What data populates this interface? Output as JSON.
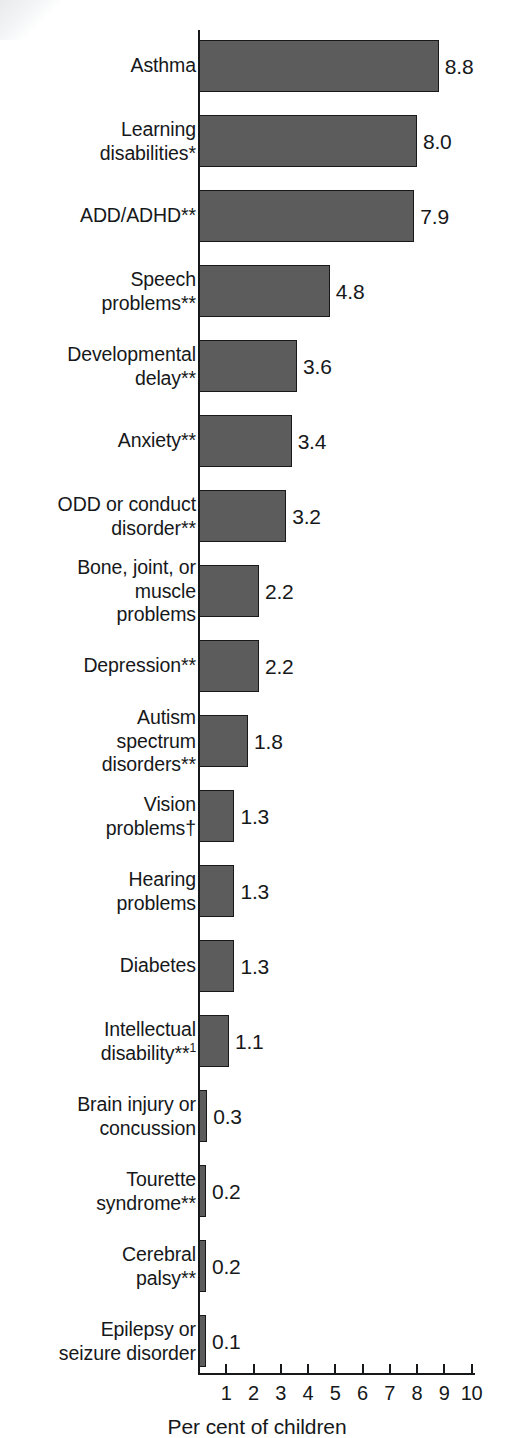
{
  "chart_data": {
    "type": "bar",
    "orientation": "horizontal",
    "title": "",
    "xlabel": "Per cent of children",
    "ylabel": "",
    "xlim": [
      0,
      10
    ],
    "grid": false,
    "legend": null,
    "tick_labels": [
      "1",
      "2",
      "3",
      "4",
      "5",
      "6",
      "7",
      "8",
      "9",
      "10"
    ],
    "categories": [
      "Asthma",
      "Learning disabilities*",
      "ADD/ADHD**",
      "Speech problems**",
      "Developmental delay**",
      "Anxiety**",
      "ODD or conduct disorder**",
      "Bone, joint, or muscle problems",
      "Depression**",
      "Autism spectrum disorders**",
      "Vision problems†",
      "Hearing problems",
      "Diabetes",
      "Intellectual disability**¹",
      "Brain injury or concussion",
      "Tourette syndrome**",
      "Cerebral palsy**",
      "Epilepsy or seizure disorder"
    ],
    "values": [
      8.8,
      8.0,
      7.9,
      4.8,
      3.6,
      3.4,
      3.2,
      2.2,
      2.2,
      1.8,
      1.3,
      1.3,
      1.3,
      1.1,
      0.3,
      0.2,
      0.2,
      0.1
    ],
    "value_labels": [
      "8.8",
      "8.0",
      "7.9",
      "4.8",
      "3.6",
      "3.4",
      "3.2",
      "2.2",
      "2.2",
      "1.8",
      "1.3",
      "1.3",
      "1.3",
      "1.1",
      "0.3",
      "0.2",
      "0.2",
      "0.1"
    ],
    "bar_color": "#5c5c5c",
    "bar_edge_color": "#16181a"
  },
  "rows": [
    {
      "label_lines": [
        "Asthma"
      ],
      "value": "8.8"
    },
    {
      "label_lines": [
        "Learning",
        "disabilities*"
      ],
      "value": "8.0"
    },
    {
      "label_lines": [
        "ADD/ADHD**"
      ],
      "value": "7.9"
    },
    {
      "label_lines": [
        "Speech",
        "problems**"
      ],
      "value": "4.8"
    },
    {
      "label_lines": [
        "Developmental",
        "delay**"
      ],
      "value": "3.6"
    },
    {
      "label_lines": [
        "Anxiety**"
      ],
      "value": "3.4"
    },
    {
      "label_lines": [
        "ODD or conduct",
        "disorder**"
      ],
      "value": "3.2"
    },
    {
      "label_lines": [
        "Bone, joint, or",
        "muscle",
        "problems"
      ],
      "value": "2.2"
    },
    {
      "label_lines": [
        "Depression**"
      ],
      "value": "2.2"
    },
    {
      "label_lines": [
        "Autism",
        "spectrum",
        "disorders**"
      ],
      "value": "1.8"
    },
    {
      "label_lines": [
        "Vision",
        "problems†"
      ],
      "value": "1.3"
    },
    {
      "label_lines": [
        "Hearing",
        "problems"
      ],
      "value": "1.3"
    },
    {
      "label_lines": [
        "Diabetes"
      ],
      "value": "1.3"
    },
    {
      "label_lines": [
        "Intellectual",
        "disability**¹"
      ],
      "value": "1.1"
    },
    {
      "label_lines": [
        "Brain injury or",
        "concussion"
      ],
      "value": "0.3"
    },
    {
      "label_lines": [
        "Tourette",
        "syndrome**"
      ],
      "value": "0.2"
    },
    {
      "label_lines": [
        "Cerebral",
        "palsy**"
      ],
      "value": "0.2"
    },
    {
      "label_lines": [
        "Epilepsy or",
        "seizure disorder"
      ],
      "value": "0.1"
    }
  ],
  "axis": {
    "title": "Per cent of children",
    "ticks": [
      "1",
      "2",
      "3",
      "4",
      "5",
      "6",
      "7",
      "8",
      "9",
      "10"
    ]
  }
}
